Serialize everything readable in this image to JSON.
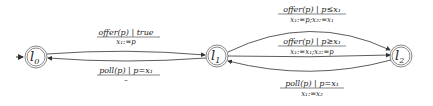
{
  "diagram": {
    "type": "automaton",
    "states": [
      {
        "id": "l0",
        "label": "l",
        "subscript": "0",
        "initial": true
      },
      {
        "id": "l1",
        "label": "l",
        "subscript": "1",
        "initial": false
      },
      {
        "id": "l2",
        "label": "l",
        "subscript": "2",
        "initial": false
      }
    ],
    "transitions": [
      {
        "from": "l0",
        "to": "l1",
        "guard": "offer(p) | true",
        "update": "x₁:=p"
      },
      {
        "from": "l1",
        "to": "l0",
        "guard": "poll(p) | p=x₁",
        "update": "–"
      },
      {
        "from": "l1",
        "to": "l2",
        "guard": "offer(p) | p≤x₁",
        "update": "x₁:=p;x₂:=x₁"
      },
      {
        "from": "l1",
        "to": "l2",
        "guard": "offer(p) | p≥x₁",
        "update": "x₁:=x₁;x₂:=p"
      },
      {
        "from": "l2",
        "to": "l1",
        "guard": "poll(p) | p=x₁",
        "update": "x₁:=x₂"
      }
    ]
  },
  "colors": {
    "node_stroke": "#8a8a8a",
    "edge": "#333333",
    "text": "#222222"
  }
}
